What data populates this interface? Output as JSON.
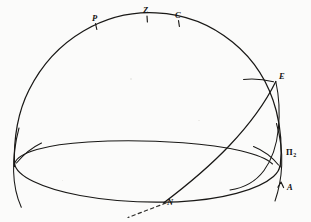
{
  "figure": {
    "kind": "celestial-sphere-diagram",
    "caption": "",
    "background_color": "#fbfbfa",
    "ink_color": "#191816"
  },
  "labels": {
    "pole": "P",
    "zenith": "Z",
    "culmination": "C",
    "east_point": "E",
    "plane_pi2": "Π",
    "plane_pi2_subscript": "2",
    "ascending_node_arrow": "A",
    "node": "N"
  },
  "label_positions": {
    "pole": {
      "x": 95,
      "y": 18
    },
    "zenith": {
      "x": 145,
      "y": 12
    },
    "culmination": {
      "x": 175,
      "y": 16
    },
    "east_point": {
      "x": 259,
      "y": 73
    },
    "plane_pi2": {
      "x": 283,
      "y": 153
    },
    "ascending_node_arrow": {
      "x": 289,
      "y": 186
    },
    "node": {
      "x": 166,
      "y": 197
    }
  },
  "geometry": {
    "sphere": {
      "cx": 147,
      "cy": 160,
      "r": 133
    },
    "horizon_ellipse": {
      "cx": 147,
      "cy": 160,
      "rx": 133,
      "ry": 29
    },
    "node_point": {
      "x": 168,
      "y": 201
    },
    "east_point": {
      "x": 275,
      "y": 82
    },
    "pole_tick": {
      "x": 96,
      "y": 27
    },
    "zenith_tick": {
      "x": 147,
      "y": 20
    },
    "culmination_tick": {
      "x": 179,
      "y": 25
    }
  },
  "elements": [
    {
      "name": "meridian-great-circle",
      "description": "large circle outlining the celestial sphere"
    },
    {
      "name": "horizon-circle",
      "description": "ellipse representing the horizon plane in perspective"
    },
    {
      "name": "inclined-orbit-arc",
      "description": "arc from node N rising to east point E"
    },
    {
      "name": "node-dashed-line",
      "description": "dashed line of nodes extending below-left from N"
    },
    {
      "name": "left-vertical-arc",
      "description": "arc crossing the sphere outline at the left horizon point"
    },
    {
      "name": "right-vertical-arc",
      "description": "arc crossing the sphere outline at the right horizon point"
    },
    {
      "name": "left-arc-stub",
      "description": "short arc stub inside the left horizon point"
    },
    {
      "name": "right-arc-stub",
      "description": "short arc stub inside the right horizon point near Π₂"
    },
    {
      "name": "east-arc-stub",
      "description": "short arc stub to the left of point E"
    },
    {
      "name": "ascending-arrow",
      "description": "small arrowhead on the right vertical arc marked A"
    }
  ]
}
